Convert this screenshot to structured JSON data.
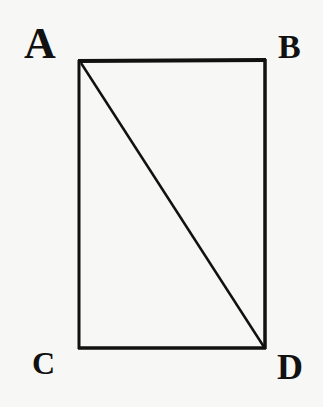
{
  "diagram": {
    "type": "geometric-figure",
    "stroke_color": "#111111",
    "background_color": "#f7f7f5",
    "points": {
      "A": {
        "label": "A",
        "x": 79,
        "y": 61
      },
      "B": {
        "label": "B",
        "x": 265,
        "y": 60
      },
      "C": {
        "label": "C",
        "x": 79,
        "y": 348
      },
      "D": {
        "label": "D",
        "x": 265,
        "y": 348
      }
    },
    "edges": [
      {
        "from": "A",
        "to": "B"
      },
      {
        "from": "B",
        "to": "D"
      },
      {
        "from": "D",
        "to": "C"
      },
      {
        "from": "C",
        "to": "A"
      },
      {
        "from": "A",
        "to": "D",
        "kind": "diagonal"
      }
    ]
  }
}
